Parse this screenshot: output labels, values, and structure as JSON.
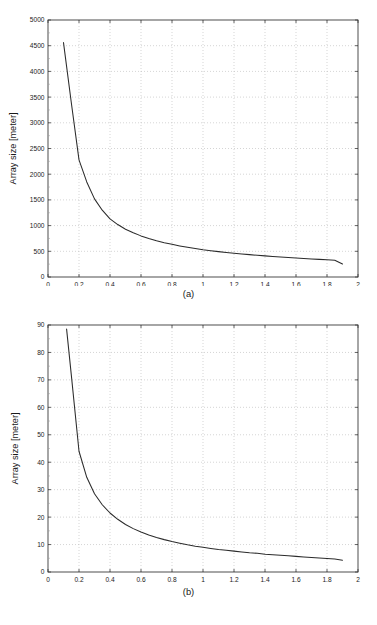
{
  "document": {
    "type": "figure-pair",
    "background": "#ffffff",
    "ink_color": "#2b2b2b",
    "grid_color": "#b9b9b9"
  },
  "figures": [
    {
      "id": "a",
      "caption": "(a)",
      "chart_data": {
        "type": "line",
        "title": "",
        "subtitle": "",
        "xlabel": "The radius of the central cell [km]",
        "ylabel": "Array size [meter]",
        "xlim": [
          0,
          2
        ],
        "ylim": [
          0,
          5000
        ],
        "xticks": [
          0,
          0.2,
          0.4,
          0.6,
          0.8,
          1,
          1.2,
          1.4,
          1.6,
          1.8,
          2
        ],
        "xticklabels": [
          "0",
          "0.2",
          "0.4",
          "0.6",
          "0.8",
          "1",
          "1.2",
          "1.4",
          "1.6",
          "1.8",
          "2"
        ],
        "yticks": [
          0,
          500,
          1000,
          1500,
          2000,
          2500,
          3000,
          3500,
          4000,
          4500,
          5000
        ],
        "yticklabels": [
          "0",
          "500",
          "1000",
          "1500",
          "2000",
          "2500",
          "3000",
          "3500",
          "4000",
          "4500",
          "5000"
        ],
        "grid": true,
        "legend": null,
        "series": [
          {
            "name": "Array size vs central cell radius",
            "color": "#2b2b2b",
            "x": [
              0.1,
              0.15,
              0.2,
              0.25,
              0.3,
              0.35,
              0.4,
              0.45,
              0.5,
              0.55,
              0.6,
              0.65,
              0.7,
              0.75,
              0.8,
              0.85,
              0.9,
              0.95,
              1.0,
              1.05,
              1.1,
              1.15,
              1.2,
              1.25,
              1.3,
              1.35,
              1.4,
              1.45,
              1.5,
              1.55,
              1.6,
              1.65,
              1.7,
              1.75,
              1.8,
              1.85,
              1.9
            ],
            "y": [
              4560,
              3400,
              2280,
              1850,
              1520,
              1300,
              1130,
              1020,
              930,
              860,
              800,
              750,
              705,
              668,
              635,
              605,
              578,
              553,
              530,
              512,
              494,
              478,
              462,
              448,
              435,
              423,
              411,
              400,
              389,
              379,
              370,
              360,
              352,
              343,
              335,
              327,
              252
            ]
          }
        ]
      }
    },
    {
      "id": "b",
      "caption": "(b)",
      "chart_data": {
        "type": "line",
        "title": "",
        "subtitle": "",
        "xlabel": "The radius of the central cell [km]",
        "ylabel": "Array size [meter]",
        "xlim": [
          0,
          2
        ],
        "ylim": [
          0,
          90
        ],
        "xticks": [
          0,
          0.2,
          0.4,
          0.6,
          0.8,
          1,
          1.2,
          1.4,
          1.6,
          1.8,
          2
        ],
        "xticklabels": [
          "0",
          "0.2",
          "0.4",
          "0.6",
          "0.8",
          "1",
          "1.2",
          "1.4",
          "1.6",
          "1.8",
          "2"
        ],
        "yticks": [
          0,
          10,
          20,
          30,
          40,
          50,
          60,
          70,
          80,
          90
        ],
        "yticklabels": [
          "0",
          "10",
          "20",
          "30",
          "40",
          "50",
          "60",
          "70",
          "80",
          "90"
        ],
        "grid": true,
        "legend": null,
        "series": [
          {
            "name": "Array size vs central cell radius",
            "color": "#2b2b2b",
            "x": [
              0.12,
              0.15,
              0.2,
              0.25,
              0.3,
              0.35,
              0.4,
              0.45,
              0.5,
              0.55,
              0.6,
              0.65,
              0.7,
              0.75,
              0.8,
              0.85,
              0.9,
              0.95,
              1.0,
              1.05,
              1.1,
              1.15,
              1.2,
              1.25,
              1.3,
              1.35,
              1.4,
              1.45,
              1.5,
              1.55,
              1.6,
              1.65,
              1.7,
              1.75,
              1.8,
              1.85,
              1.9
            ],
            "y": [
              88.5,
              72.0,
              44.0,
              34.5,
              28.5,
              24.5,
              21.5,
              19.2,
              17.3,
              15.8,
              14.6,
              13.5,
              12.6,
              11.8,
              11.1,
              10.5,
              9.9,
              9.4,
              9.0,
              8.6,
              8.2,
              7.9,
              7.6,
              7.3,
              7.0,
              6.8,
              6.5,
              6.3,
              6.1,
              5.9,
              5.7,
              5.5,
              5.3,
              5.1,
              4.9,
              4.7,
              4.3
            ]
          }
        ]
      }
    }
  ]
}
